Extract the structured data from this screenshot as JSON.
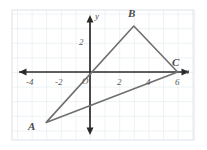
{
  "chart_data": {
    "type": "scatter",
    "title": "",
    "xlabel": "x",
    "ylabel": "y",
    "grid": true,
    "legend_position": "none",
    "xlim": [
      -5.33,
      8.0
    ],
    "ylim": [
      -4.67,
      4.26
    ],
    "x_ticks": [
      -4,
      -2,
      2,
      4,
      6
    ],
    "x_tick_labels": [
      "-4",
      "-2",
      "2",
      "4",
      "6"
    ],
    "y_ticks": [
      2
    ],
    "y_tick_labels": [
      "2"
    ],
    "origin_label": "O",
    "grid_step": 1,
    "series": [
      {
        "name": "Triangle ABC",
        "type": "polygon",
        "closed": true,
        "points": [
          {
            "label": "A",
            "x": -3.0,
            "y": -3.45
          },
          {
            "label": "B",
            "x": 3.0,
            "y": 3.15
          },
          {
            "label": "C",
            "x": 6.0,
            "y": 0.0
          }
        ]
      }
    ],
    "annotations": [
      {
        "text": "A",
        "x": -3.95,
        "y": -3.85
      },
      {
        "text": "B",
        "x": 2.75,
        "y": 4.0
      },
      {
        "text": "C",
        "x": 5.75,
        "y": 0.85
      },
      {
        "text": "x",
        "x": 7.35,
        "y": -0.5
      },
      {
        "text": "y",
        "x": 0.48,
        "y": 3.95
      }
    ],
    "colors": {
      "grid": "#d8e0e8",
      "axis": "#2b2b2b",
      "shape_stroke": "#6f6f6f",
      "label_text": "#4a4a4a",
      "tick_text": "#5b5b5b",
      "background": "#ffffff"
    }
  },
  "geometry": {
    "origin_px": {
      "x": 90,
      "y": 72
    },
    "unit_px": 14.6,
    "grid_bounds_px": {
      "left": 12,
      "top": 10,
      "right": 194,
      "bottom": 140
    }
  },
  "labels": {
    "tick_neg4": "-4",
    "tick_neg2": "-2",
    "tick_2": "2",
    "tick_4": "4",
    "tick_6": "6",
    "tick_y2": "2",
    "origin": "O",
    "vertex_a": "A",
    "vertex_b": "B",
    "vertex_c": "C",
    "axis_x": "x",
    "axis_y": "y"
  }
}
